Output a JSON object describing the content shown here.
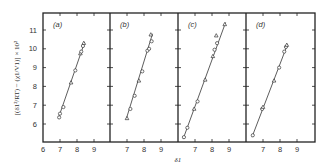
{
  "chart_data": {
    "type": "scatter",
    "title": "",
    "xlabel": "δ1",
    "ylabel": "[(δ1²/RT) − (χ1/V1)] × 10²",
    "ylim": [
      5,
      12
    ],
    "yticks": [
      6,
      7,
      8,
      9,
      10,
      11
    ],
    "grid": false,
    "legend": null,
    "panels": [
      {
        "label": "(a)",
        "xlim": [
          6,
          10
        ],
        "xticks": [
          6,
          7,
          8,
          9
        ],
        "points": [
          {
            "x": 6.95,
            "y": 6.35,
            "marker": "circle"
          },
          {
            "x": 7.0,
            "y": 6.55,
            "marker": "circle"
          },
          {
            "x": 7.2,
            "y": 6.9,
            "marker": "circle"
          },
          {
            "x": 7.65,
            "y": 8.2,
            "marker": "triangle"
          },
          {
            "x": 7.9,
            "y": 8.85,
            "marker": "circle"
          },
          {
            "x": 8.2,
            "y": 9.75,
            "marker": "triangle"
          },
          {
            "x": 8.25,
            "y": 9.85,
            "marker": "circle"
          },
          {
            "x": 8.35,
            "y": 10.15,
            "marker": "circle"
          },
          {
            "x": 8.4,
            "y": 10.3,
            "marker": "triangle"
          }
        ],
        "fit_line": {
          "x": [
            6.9,
            8.45
          ],
          "y": [
            6.3,
            10.35
          ]
        }
      },
      {
        "label": "(b)",
        "xlim": [
          6,
          10
        ],
        "xticks": [
          7,
          8,
          9
        ],
        "points": [
          {
            "x": 7.0,
            "y": 6.3,
            "marker": "triangle"
          },
          {
            "x": 7.2,
            "y": 6.8,
            "marker": "circle"
          },
          {
            "x": 7.45,
            "y": 7.5,
            "marker": "circle"
          },
          {
            "x": 7.7,
            "y": 8.3,
            "marker": "triangle"
          },
          {
            "x": 7.9,
            "y": 8.8,
            "marker": "circle"
          },
          {
            "x": 8.2,
            "y": 9.9,
            "marker": "circle"
          },
          {
            "x": 8.3,
            "y": 10.0,
            "marker": "circle"
          },
          {
            "x": 8.45,
            "y": 10.4,
            "marker": "circle"
          },
          {
            "x": 8.4,
            "y": 10.75,
            "marker": "triangle"
          }
        ],
        "fit_line": {
          "x": [
            6.95,
            8.5
          ],
          "y": [
            6.25,
            10.8
          ]
        }
      },
      {
        "label": "(c)",
        "xlim": [
          6,
          10
        ],
        "xticks": [
          7,
          8,
          9
        ],
        "points": [
          {
            "x": 6.35,
            "y": 5.3,
            "marker": "circle"
          },
          {
            "x": 6.55,
            "y": 5.8,
            "marker": "circle"
          },
          {
            "x": 6.95,
            "y": 6.8,
            "marker": "triangle"
          },
          {
            "x": 7.15,
            "y": 7.2,
            "marker": "circle"
          },
          {
            "x": 7.6,
            "y": 8.35,
            "marker": "triangle"
          },
          {
            "x": 8.05,
            "y": 9.6,
            "marker": "triangle"
          },
          {
            "x": 8.15,
            "y": 9.95,
            "marker": "circle"
          },
          {
            "x": 8.3,
            "y": 10.3,
            "marker": "circle"
          },
          {
            "x": 8.25,
            "y": 10.7,
            "marker": "triangle"
          },
          {
            "x": 8.75,
            "y": 11.3,
            "marker": "triangle"
          }
        ],
        "fit_line": {
          "x": [
            6.3,
            8.8
          ],
          "y": [
            5.2,
            11.4
          ]
        }
      },
      {
        "label": "(d)",
        "xlim": [
          6,
          10
        ],
        "xticks": [
          7,
          8,
          9
        ],
        "points": [
          {
            "x": 6.4,
            "y": 5.4,
            "marker": "circle"
          },
          {
            "x": 6.95,
            "y": 6.8,
            "marker": "circle"
          },
          {
            "x": 7.0,
            "y": 6.9,
            "marker": "triangle"
          },
          {
            "x": 7.65,
            "y": 8.3,
            "marker": "triangle"
          },
          {
            "x": 7.95,
            "y": 9.0,
            "marker": "circle"
          },
          {
            "x": 8.25,
            "y": 9.85,
            "marker": "circle"
          },
          {
            "x": 8.35,
            "y": 10.1,
            "marker": "circle"
          },
          {
            "x": 8.4,
            "y": 10.2,
            "marker": "triangle"
          }
        ],
        "fit_line": {
          "x": [
            6.35,
            8.45
          ],
          "y": [
            5.3,
            10.25
          ]
        }
      }
    ]
  }
}
